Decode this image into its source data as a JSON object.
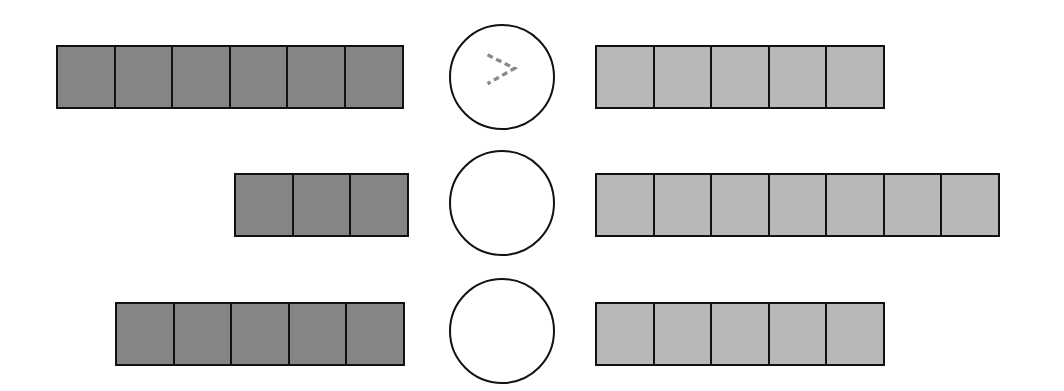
{
  "diagram": {
    "colors": {
      "left_fill": "#858585",
      "right_fill": "#b8b8b8",
      "border": "#111111",
      "symbol": "#8a8a8a"
    },
    "rows": [
      {
        "left_count": 6,
        "right_count": 5,
        "symbol": ">",
        "symbol_style": "dashed"
      },
      {
        "left_count": 3,
        "right_count": 7,
        "symbol": "",
        "symbol_style": "empty"
      },
      {
        "left_count": 5,
        "right_count": 5,
        "symbol": "",
        "symbol_style": "empty"
      }
    ]
  }
}
